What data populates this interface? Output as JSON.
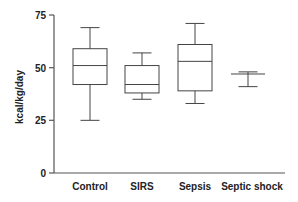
{
  "chart_data": {
    "type": "boxplot",
    "title": "",
    "xlabel": "",
    "ylabel": "kcal/kg/day",
    "ylim": [
      0,
      75
    ],
    "yticks": [
      0,
      25,
      50,
      75
    ],
    "grid": false,
    "legend": null,
    "categories": [
      "Control",
      "SIRS",
      "Sepsis",
      "Septic shock"
    ],
    "series": [
      {
        "name": "Control",
        "whisker_low": 25,
        "q1": 42,
        "median": 51,
        "q3": 59,
        "whisker_high": 69
      },
      {
        "name": "SIRS",
        "whisker_low": 35,
        "q1": 38,
        "median": 42,
        "q3": 51,
        "whisker_high": 57
      },
      {
        "name": "Sepsis",
        "whisker_low": 33,
        "q1": 39,
        "median": 53,
        "q3": 61,
        "whisker_high": 71
      },
      {
        "name": "Septic shock",
        "whisker_low": 41,
        "q1": 47,
        "median": 47,
        "q3": 47,
        "whisker_high": 48
      }
    ]
  },
  "axis": {
    "y_title": "kcal/kg/day",
    "y_ticks": [
      "0",
      "25",
      "50",
      "75"
    ]
  },
  "labels": {
    "cat0": "Control",
    "cat1": "SIRS",
    "cat2": "Sepsis",
    "cat3": "Septic shock"
  }
}
